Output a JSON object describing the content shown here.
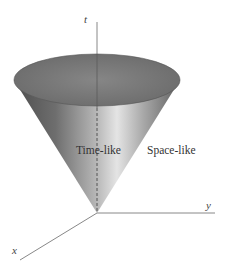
{
  "diagram": {
    "type": "light-cone",
    "axes": {
      "t": "t",
      "x": "x",
      "y": "y"
    },
    "regions": {
      "inside": "Time-like",
      "outside": "Space-like"
    },
    "colors": {
      "cone_dark": "#5a5a5a",
      "cone_light": "#d8d8d8",
      "top_ellipse": "#7a7a7a",
      "axis": "#777777"
    }
  }
}
